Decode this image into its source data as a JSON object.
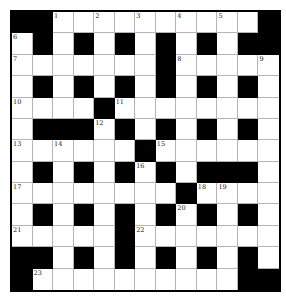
{
  "puzzle": {
    "rows": 13,
    "cols": 13,
    "colors": {
      "block": "#000000",
      "cell": "#ffffff",
      "gridline": "#b5b5b5",
      "number": "#222222"
    },
    "layout": [
      "##WWWWWWWWWW#",
      "W#W#W#W#W#W##",
      "WWWWWWW#WWWWW",
      "W#W#W#W#W#W#W",
      "WWWW#WWWWWWWW",
      "W###W#W#W#W#W",
      "WWWWWW#WWWWWW",
      "W#W#W#W#W###W",
      "WWWWWWWW#WWWW",
      "W#W#W#W#W#W#W",
      "WWWWW#WWWWWWW",
      "##W#W#W#W#W#W",
      "#WWWWWWWWWW##"
    ],
    "numbers": [
      {
        "n": "1",
        "r": 0,
        "c": 2
      },
      {
        "n": "2",
        "r": 0,
        "c": 4
      },
      {
        "n": "3",
        "r": 0,
        "c": 6
      },
      {
        "n": "4",
        "r": 0,
        "c": 8
      },
      {
        "n": "5",
        "r": 0,
        "c": 10
      },
      {
        "n": "6",
        "r": 1,
        "c": 0
      },
      {
        "n": "7",
        "r": 2,
        "c": 0
      },
      {
        "n": "8",
        "r": 2,
        "c": 8
      },
      {
        "n": "9",
        "r": 2,
        "c": 12
      },
      {
        "n": "10",
        "r": 4,
        "c": 0
      },
      {
        "n": "11",
        "r": 4,
        "c": 5
      },
      {
        "n": "12",
        "r": 5,
        "c": 4
      },
      {
        "n": "13",
        "r": 6,
        "c": 0
      },
      {
        "n": "14",
        "r": 6,
        "c": 2
      },
      {
        "n": "15",
        "r": 6,
        "c": 7
      },
      {
        "n": "16",
        "r": 7,
        "c": 6
      },
      {
        "n": "17",
        "r": 8,
        "c": 0
      },
      {
        "n": "18",
        "r": 8,
        "c": 9
      },
      {
        "n": "19",
        "r": 8,
        "c": 10
      },
      {
        "n": "20",
        "r": 9,
        "c": 8
      },
      {
        "n": "21",
        "r": 10,
        "c": 0
      },
      {
        "n": "22",
        "r": 10,
        "c": 6
      },
      {
        "n": "23",
        "r": 12,
        "c": 1
      }
    ]
  }
}
